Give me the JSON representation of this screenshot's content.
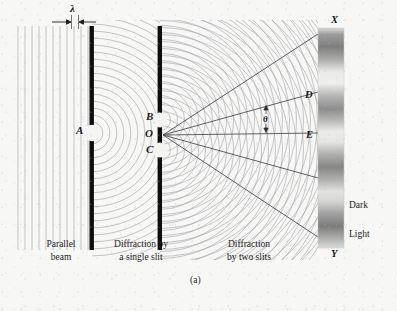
{
  "figure": {
    "panel_label": "(a)",
    "title_hidden": ""
  },
  "annotations": {
    "wavelength": "λ",
    "angle": "θ",
    "single_slit_point": "A",
    "upper_slit": "B",
    "center_point": "O",
    "lower_slit": "C",
    "screen_top": "X",
    "screen_bottom": "Y",
    "fringe_d": "D",
    "fringe_e": "E",
    "dark_band": "Dark",
    "light_band": "Light"
  },
  "captions": {
    "left_line1": "Parallel",
    "left_line2": "beam",
    "middle_line1": "Diffraction by",
    "middle_line2": "a single slit",
    "right_line1": "Diffraction",
    "right_line2": "by two slits"
  },
  "colors": {
    "background": "#f7f7f5",
    "barrier": "#0d0d0d",
    "wave_line": "#8e8e96",
    "ray_line": "#4a4a52",
    "text": "#1b1b1b",
    "screen_light": "#e8e8e6",
    "screen_dark": "#8a8a8a"
  },
  "geometry": {
    "first_barrier_x": 92,
    "second_barrier_x": 160,
    "screen_x": 318,
    "screen_width": 26,
    "screen_top_y": 28,
    "screen_bottom_y": 248,
    "slit_a_y": 133,
    "slit_b_y": 120,
    "slit_c_y": 150,
    "wavefront_count": 22,
    "wavelength_px": 7.0
  }
}
